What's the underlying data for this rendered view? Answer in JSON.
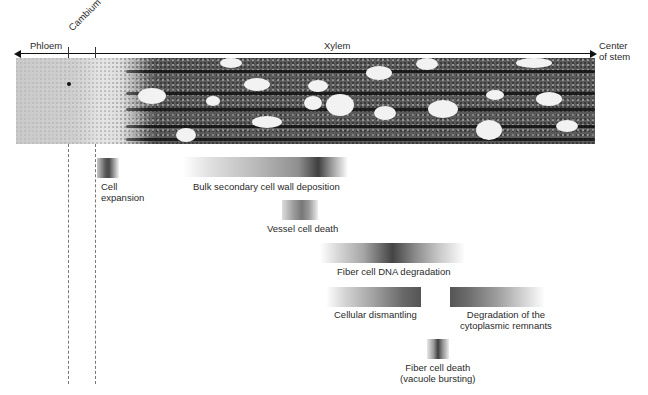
{
  "figure": {
    "axis": {
      "left_label": "Phloem",
      "cambium_label": "Cambium",
      "middle_label": "Xylem",
      "right_label_line1": "Center",
      "right_label_line2": "of stem"
    },
    "image": {
      "description": "Micrograph of developing wood cross-section (phloem, cambium, xylem)"
    },
    "processes": [
      {
        "id": "cell-expansion",
        "label_line1": "Cell",
        "label_line2": "expansion"
      },
      {
        "id": "bulk-secondary-cell-wall-deposition",
        "label_line1": "Bulk secondary cell wall deposition"
      },
      {
        "id": "vessel-cell-death",
        "label_line1": "Vessel cell death"
      },
      {
        "id": "fiber-cell-dna-degradation",
        "label_line1": "Fiber cell DNA degradation"
      },
      {
        "id": "cellular-dismantling",
        "label_line1": "Cellular dismantling"
      },
      {
        "id": "degradation-of-cytoplasmic-remnants",
        "label_line1": "Degradation of the",
        "label_line2": "cytoplasmic remnants"
      },
      {
        "id": "fiber-cell-death",
        "label_line1": "Fiber cell death",
        "label_line2": "(vacuole bursting)"
      }
    ]
  },
  "colors": {
    "bar_dark": "#3a3a3a",
    "bar_light": "#ffffff",
    "axis": "#111111"
  }
}
